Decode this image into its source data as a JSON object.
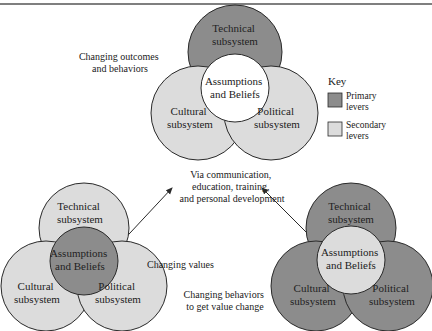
{
  "colors": {
    "primary": "#8c8c8c",
    "secondary": "#dcdcdc",
    "white": "#ffffff",
    "stroke": "#2a2a2a",
    "text": "#222222"
  },
  "top_diagram": {
    "caption": [
      "Changing outcomes",
      "and behaviors"
    ],
    "technical": [
      "Technical",
      "subsystem"
    ],
    "cultural": [
      "Cultural",
      "subsystem"
    ],
    "political": [
      "Political",
      "subsystem"
    ],
    "core": [
      "Assumptions",
      "and Beliefs"
    ]
  },
  "key": {
    "title": "Key",
    "items": [
      {
        "label": [
          "Primary",
          "levers"
        ]
      },
      {
        "label": [
          "Secondary",
          "levers"
        ]
      }
    ]
  },
  "center_text": [
    "Via communication,",
    "education, training,",
    "and personal development"
  ],
  "left_diagram": {
    "caption": "Changing values",
    "technical": [
      "Technical",
      "subsystem"
    ],
    "cultural": [
      "Cultural",
      "subsystem"
    ],
    "political": [
      "Political",
      "subsystem"
    ],
    "core": [
      "Assumptions",
      "and Beliefs"
    ]
  },
  "right_diagram": {
    "caption": [
      "Changing behaviors",
      "to get value change"
    ],
    "technical": [
      "Technical",
      "subsystem"
    ],
    "cultural": [
      "Cultural",
      "subsystem"
    ],
    "political": [
      "Political",
      "subsystem"
    ],
    "core": [
      "Assumptions",
      "and Beliefs"
    ]
  }
}
